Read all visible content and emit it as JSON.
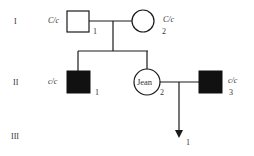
{
  "generations": [
    {
      "label": "I"
    },
    {
      "label": "II"
    },
    {
      "label": "III"
    }
  ],
  "individuals": {
    "I1": {
      "number": "1",
      "genotype": "C/c",
      "sex": "male",
      "affected": false
    },
    "I2": {
      "number": "2",
      "genotype": "C/c",
      "sex": "female",
      "affected": false
    },
    "II1": {
      "number": "1",
      "genotype": "c/c",
      "sex": "male",
      "affected": true
    },
    "II2": {
      "number": "2",
      "name": "Jean",
      "sex": "female",
      "affected": false
    },
    "II3": {
      "number": "3",
      "genotype": "c/c",
      "sex": "male",
      "affected": true
    },
    "III1": {
      "number": "1",
      "sex": "unknown",
      "affected": null
    }
  },
  "colors": {
    "line": "#1a1a1a",
    "affected_fill": "#111111",
    "text": "#333333"
  }
}
